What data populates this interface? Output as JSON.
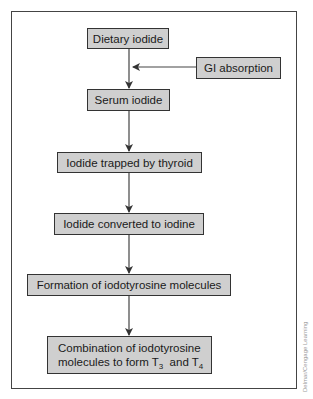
{
  "diagram": {
    "type": "flowchart",
    "nodes": [
      {
        "id": "dietary",
        "label": "Dietary iodide"
      },
      {
        "id": "gi",
        "label": "GI absorption"
      },
      {
        "id": "serum",
        "label": "Serum iodide"
      },
      {
        "id": "trapped",
        "label": "Iodide trapped by thyroid"
      },
      {
        "id": "converted",
        "label": "Iodide converted to iodine"
      },
      {
        "id": "formation",
        "label": "Formation of iodotyrosine molecules"
      },
      {
        "id": "combination",
        "line1": "Combination of iodotyrosine",
        "line2_prefix": "molecules to form T",
        "sub1": "3",
        "mid": "  and T",
        "sub2": "4"
      }
    ],
    "edges": [
      {
        "from": "dietary",
        "to": "serum"
      },
      {
        "from": "gi",
        "to": "dietary-serum-edge"
      },
      {
        "from": "serum",
        "to": "trapped"
      },
      {
        "from": "trapped",
        "to": "converted"
      },
      {
        "from": "converted",
        "to": "formation"
      },
      {
        "from": "formation",
        "to": "combination"
      }
    ]
  },
  "watermark": "Delmar/Cengage Learning"
}
